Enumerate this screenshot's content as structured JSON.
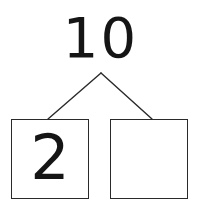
{
  "diagram": {
    "type": "number-bond",
    "whole": {
      "label": "10",
      "position": "top"
    },
    "parts": [
      {
        "label": "2",
        "position": "bottom-left",
        "filled": true
      },
      {
        "label": "",
        "position": "bottom-right",
        "filled": false
      }
    ],
    "connectors": [
      {
        "name": "left-branch",
        "from": "whole",
        "to": "part-left"
      },
      {
        "name": "right-branch",
        "from": "whole",
        "to": "part-right"
      }
    ],
    "colors": {
      "background": "#ffffff",
      "ink": "#151515",
      "box_border": "#2a2a2a",
      "connector_line": "#2a2a2a"
    }
  }
}
